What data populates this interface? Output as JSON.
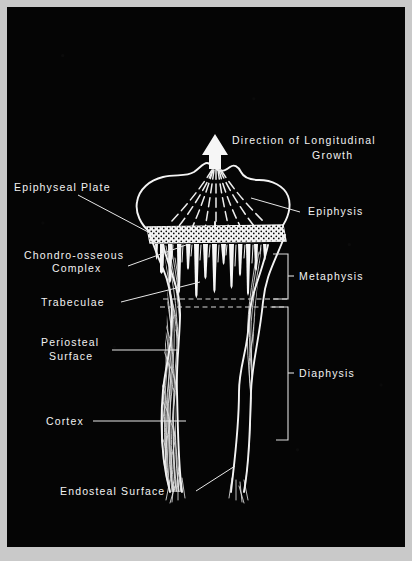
{
  "figure": {
    "kind": "anatomical-diagram",
    "background_color": "#050505",
    "ink_color": "#f2f2f2",
    "border_color": "#c9c9c9",
    "width": 412,
    "height": 561
  },
  "arrow": {
    "name": "growth-direction-arrow",
    "points": "up",
    "caption_line1": "Direction  of  Longitudinal",
    "caption_line2": "Growth"
  },
  "labels_left": [
    {
      "id": "epiphyseal-plate",
      "lines": [
        "Epiphyseal  Plate"
      ]
    },
    {
      "id": "chondro-osseous",
      "lines": [
        "Chondro-osseous",
        "Complex"
      ]
    },
    {
      "id": "trabeculae",
      "lines": [
        "Trabeculae"
      ]
    },
    {
      "id": "periosteal-surface",
      "lines": [
        "Periosteal",
        "Surface"
      ]
    },
    {
      "id": "cortex",
      "lines": [
        "Cortex"
      ]
    },
    {
      "id": "endosteal-surface",
      "lines": [
        "Endosteal   Surface"
      ]
    }
  ],
  "labels_right": [
    {
      "id": "epiphysis",
      "text": "Epiphysis",
      "style": "leader"
    },
    {
      "id": "metaphysis",
      "text": "Metaphysis",
      "style": "bracket"
    },
    {
      "id": "diaphysis",
      "text": "Diaphysis",
      "style": "bracket"
    }
  ],
  "regions": {
    "epiphysis": "dome-shaped bone end above the growth plate",
    "epiphyseal_plate": "stippled transverse cartilage band",
    "metaphysis": "flaring zone of tapered trabecular spicules",
    "diaphysis": "tubular shaft with two fibrous cortical walls"
  }
}
